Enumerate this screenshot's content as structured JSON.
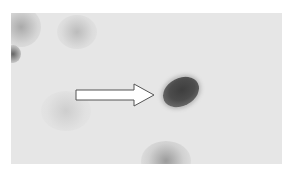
{
  "image": {
    "description": "Grayscale blot image with a white arrow pointing to a dark oval spot",
    "background_color": "#e6e6e6",
    "spot_color": "#444444",
    "arrow_fill": "#ffffff",
    "arrow_stroke": "#555555"
  },
  "annotations": {
    "arrow": {
      "direction": "right",
      "target": "dark-spot"
    }
  }
}
